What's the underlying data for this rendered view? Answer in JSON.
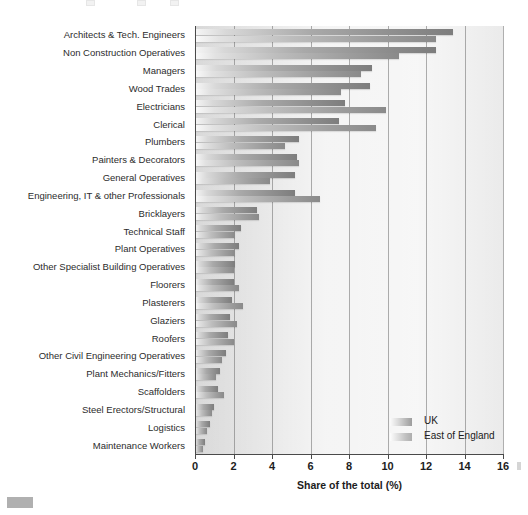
{
  "chart_data": {
    "type": "bar",
    "orientation": "horizontal",
    "title": "",
    "xlabel": "Share of the total (%)",
    "ylabel": "",
    "xlim": [
      0,
      16
    ],
    "xticks": [
      0,
      2,
      4,
      6,
      8,
      10,
      12,
      14,
      16
    ],
    "grid": true,
    "legend_position": "bottom-right",
    "categories": [
      "Architects & Tech. Engineers",
      "Non Construction Operatives",
      "Managers",
      "Wood Trades",
      "Electricians",
      "Clerical",
      "Plumbers",
      "Painters & Decorators",
      "General Operatives",
      "Engineering, IT & other Professionals",
      "Bricklayers",
      "Technical Staff",
      "Plant Operatives",
      "Other Specialist Building Operatives",
      "Floorers",
      "Plasterers",
      "Glaziers",
      "Roofers",
      "Other Civil Engineering Operatives",
      "Plant Mechanics/Fitters",
      "Scaffolders",
      "Steel Erectors/Structural",
      "Logistics",
      "Maintenance Workers"
    ],
    "series": [
      {
        "name": "UK",
        "values": [
          13.4,
          12.5,
          9.2,
          9.1,
          7.8,
          7.5,
          5.4,
          5.3,
          5.2,
          5.2,
          3.2,
          2.4,
          2.3,
          2.1,
          2.0,
          1.9,
          1.8,
          1.7,
          1.6,
          1.3,
          1.2,
          1.0,
          0.8,
          0.5
        ]
      },
      {
        "name": "East of England",
        "values": [
          12.5,
          10.6,
          8.6,
          7.6,
          9.9,
          9.4,
          4.7,
          5.4,
          3.9,
          6.5,
          3.3,
          2.1,
          2.1,
          2.0,
          2.3,
          2.5,
          2.2,
          2.0,
          1.4,
          1.1,
          1.5,
          0.9,
          0.6,
          0.4
        ]
      }
    ]
  },
  "legend": {
    "items": [
      {
        "label": "UK",
        "key": "uk"
      },
      {
        "label": "East of England",
        "key": "eoe"
      }
    ]
  },
  "axis": {
    "x_title": "Share of the total (%)",
    "tick_labels": [
      "0",
      "2",
      "4",
      "6",
      "8",
      "10",
      "12",
      "14",
      "16"
    ]
  },
  "colors": {
    "plot_background": "#d9d9d9",
    "gridline": "#6e6e6e",
    "axis": "#4a4a4a",
    "uk_bar": "#8e8e8e",
    "eoe_bar": "#b0b0b0",
    "text": "#2c2c2c"
  }
}
